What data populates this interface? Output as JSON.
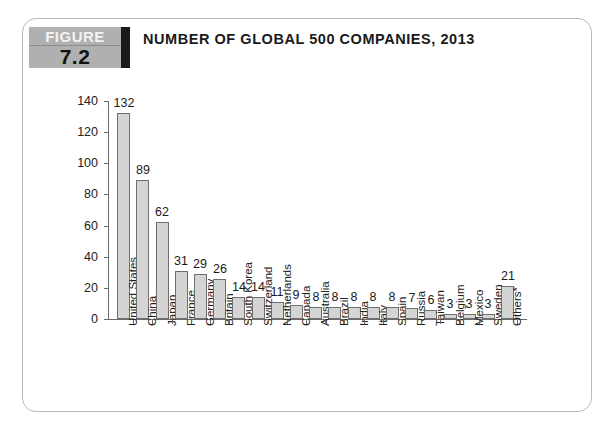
{
  "figure": {
    "badge_label": "FIGURE",
    "badge_number": "7.2"
  },
  "title": "NUMBER OF GLOBAL 500 COMPANIES, 2013",
  "chart_data": {
    "type": "bar",
    "title": "NUMBER OF GLOBAL 500 COMPANIES, 2013",
    "xlabel": "",
    "ylabel": "",
    "ylim": [
      0,
      140
    ],
    "yticks": [
      0,
      20,
      40,
      60,
      80,
      100,
      120,
      140
    ],
    "grid": false,
    "legend": false,
    "bar_color": "#d4d4d4",
    "bar_edge_color": "#6e6e6e",
    "categories": [
      "United States",
      "China",
      "Japan",
      "France",
      "Germany",
      "Britain",
      "South Korea",
      "Switzerland",
      "Netherlands",
      "Canada",
      "Australia",
      "Brazil",
      "India",
      "Italy",
      "Spain",
      "Russia",
      "Taiwan",
      "Belgium",
      "Mexico",
      "Sweden",
      "Others*"
    ],
    "values": [
      132,
      89,
      62,
      31,
      29,
      26,
      14,
      14,
      11,
      9,
      8,
      8,
      8,
      8,
      8,
      7,
      6,
      3,
      3,
      3,
      21
    ]
  }
}
